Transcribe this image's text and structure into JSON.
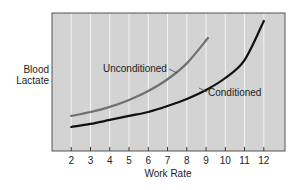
{
  "chart_data": {
    "type": "line",
    "title": "",
    "xlabel": "Work Rate",
    "ylabel": "Blood Lactate",
    "ylabel_lines": [
      "Blood",
      "Lactate"
    ],
    "x_ticks": [
      2,
      3,
      4,
      5,
      6,
      7,
      8,
      9,
      10,
      11,
      12
    ],
    "xlim": [
      1,
      13.1
    ],
    "ylim": [
      0,
      100
    ],
    "y_ticks": [],
    "grid": {
      "vertical": true,
      "horizontal": false
    },
    "background": "#d3d3d3",
    "series": [
      {
        "name": "Unconditioned",
        "color": "#707070",
        "x": [
          2,
          3,
          4,
          5,
          6,
          7,
          8,
          9.1
        ],
        "y": [
          25.4,
          28.3,
          32,
          37,
          43.5,
          52,
          63.5,
          81.9
        ]
      },
      {
        "name": "Conditioned",
        "color": "#111111",
        "x": [
          2,
          3,
          4,
          5,
          6,
          7,
          8,
          9,
          10,
          11,
          12
        ],
        "y": [
          17.4,
          19.6,
          22.5,
          25.4,
          28.3,
          32.6,
          37.7,
          44.2,
          52.9,
          65.9,
          94.2
        ]
      }
    ],
    "annotations": [
      {
        "text": "Unconditioned",
        "series": "Unconditioned"
      },
      {
        "text": "Conditioned",
        "series": "Conditioned"
      }
    ]
  },
  "labels": {
    "ylabel_line1": "Blood",
    "ylabel_line2": "Lactate",
    "xlabel": "Work Rate",
    "unconditioned": "Unconditioned",
    "conditioned": "Conditioned"
  }
}
